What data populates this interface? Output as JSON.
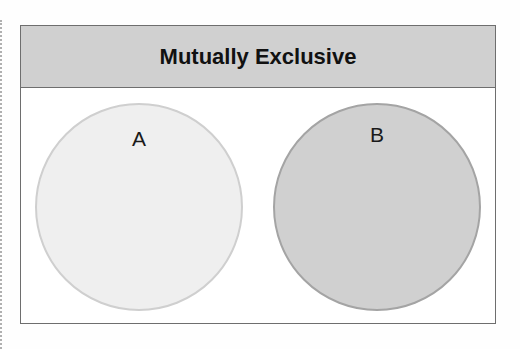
{
  "diagram": {
    "title": "Mutually Exclusive",
    "sets": [
      {
        "label": "A",
        "fill": "#efefef",
        "stroke": "#cfcfcf"
      },
      {
        "label": "B",
        "fill": "#d0d0d0",
        "stroke": "#a8a8a8"
      }
    ],
    "colors": {
      "header_bg": "#d0d0d0",
      "border": "#6e6e6e"
    }
  }
}
